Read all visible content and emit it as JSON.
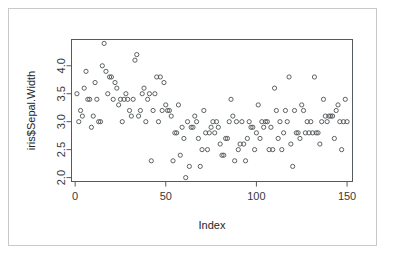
{
  "figure": {
    "width": 394,
    "height": 261,
    "background": "#ffffff",
    "border_color": "#c9c9c9",
    "point_stroke": "#4c5154",
    "axis_color": "#555a5e"
  },
  "chart_data": {
    "type": "scatter",
    "title": "",
    "xlabel": "Index",
    "ylabel": "iris$Sepal.Width",
    "xlim": [
      -2.0,
      153.0
    ],
    "ylim": [
      1.93,
      4.47
    ],
    "xticks": [
      0,
      50,
      100,
      150
    ],
    "yticks": [
      2.0,
      2.5,
      3.0,
      3.5,
      4.0
    ],
    "xtick_labels": [
      "0",
      "50",
      "100",
      "150"
    ],
    "ytick_labels": [
      "2.0",
      "2.5",
      "3.0",
      "3.5",
      "4.0"
    ],
    "grid": false,
    "legend": false,
    "marker": "open-circle",
    "marker_radius_px": 2.1,
    "n_points": 150,
    "x": [
      1,
      2,
      3,
      4,
      5,
      6,
      7,
      8,
      9,
      10,
      11,
      12,
      13,
      14,
      15,
      16,
      17,
      18,
      19,
      20,
      21,
      22,
      23,
      24,
      25,
      26,
      27,
      28,
      29,
      30,
      31,
      32,
      33,
      34,
      35,
      36,
      37,
      38,
      39,
      40,
      41,
      42,
      43,
      44,
      45,
      46,
      47,
      48,
      49,
      50,
      51,
      52,
      53,
      54,
      55,
      56,
      57,
      58,
      59,
      60,
      61,
      62,
      63,
      64,
      65,
      66,
      67,
      68,
      69,
      70,
      71,
      72,
      73,
      74,
      75,
      76,
      77,
      78,
      79,
      80,
      81,
      82,
      83,
      84,
      85,
      86,
      87,
      88,
      89,
      90,
      91,
      92,
      93,
      94,
      95,
      96,
      97,
      98,
      99,
      100,
      101,
      102,
      103,
      104,
      105,
      106,
      107,
      108,
      109,
      110,
      111,
      112,
      113,
      114,
      115,
      116,
      117,
      118,
      119,
      120,
      121,
      122,
      123,
      124,
      125,
      126,
      127,
      128,
      129,
      130,
      131,
      132,
      133,
      134,
      135,
      136,
      137,
      138,
      139,
      140,
      141,
      142,
      143,
      144,
      145,
      146,
      147,
      148,
      149,
      150
    ],
    "y": [
      3.5,
      3.0,
      3.2,
      3.1,
      3.6,
      3.9,
      3.4,
      3.4,
      2.9,
      3.1,
      3.7,
      3.4,
      3.0,
      3.0,
      4.0,
      4.4,
      3.9,
      3.5,
      3.8,
      3.8,
      3.4,
      3.7,
      3.6,
      3.3,
      3.4,
      3.0,
      3.4,
      3.5,
      3.4,
      3.2,
      3.1,
      3.4,
      4.1,
      4.2,
      3.1,
      3.2,
      3.5,
      3.6,
      3.0,
      3.4,
      3.5,
      2.3,
      3.2,
      3.5,
      3.8,
      3.0,
      3.8,
      3.2,
      3.7,
      3.3,
      3.2,
      3.2,
      3.1,
      2.3,
      2.8,
      2.8,
      3.3,
      2.4,
      2.9,
      2.7,
      2.0,
      3.0,
      2.2,
      2.9,
      2.9,
      3.1,
      3.0,
      2.7,
      2.2,
      2.5,
      3.2,
      2.8,
      2.5,
      2.8,
      2.9,
      3.0,
      2.8,
      3.0,
      2.9,
      2.6,
      2.4,
      2.4,
      2.7,
      2.7,
      3.0,
      3.4,
      3.1,
      2.3,
      3.0,
      2.5,
      2.6,
      3.0,
      2.6,
      2.3,
      2.7,
      3.0,
      2.9,
      2.9,
      2.5,
      2.8,
      3.3,
      2.7,
      3.0,
      2.9,
      3.0,
      3.0,
      2.5,
      2.9,
      2.5,
      3.6,
      3.2,
      2.7,
      3.0,
      2.5,
      2.8,
      3.2,
      3.0,
      3.8,
      2.6,
      2.2,
      3.2,
      2.8,
      2.8,
      2.7,
      3.3,
      3.2,
      2.8,
      3.0,
      2.8,
      3.0,
      2.8,
      3.8,
      2.8,
      2.8,
      2.6,
      3.0,
      3.4,
      3.1,
      3.0,
      3.1,
      3.1,
      3.1,
      2.7,
      3.2,
      3.3,
      3.0,
      2.5,
      3.0,
      3.4,
      3.0
    ]
  }
}
